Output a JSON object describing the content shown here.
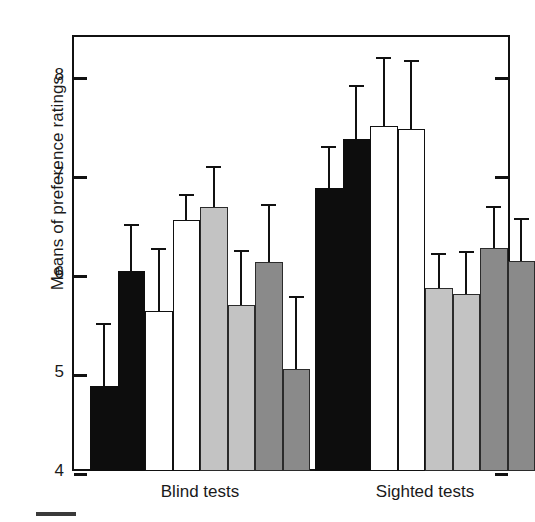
{
  "chart_data": {
    "type": "bar",
    "title": "",
    "xlabel": "",
    "ylabel": "Means of preference ratings",
    "ylim": [
      4,
      8.4
    ],
    "yticks": [
      4,
      5,
      6,
      7,
      8
    ],
    "ytick_labels": [
      "4",
      "5",
      "6",
      "7",
      "8"
    ],
    "grid": false,
    "legend": "none",
    "error_bars": "standard deviation / confidence interval (upper caps only)",
    "categories": [
      "Blind tests",
      "Sighted tests"
    ],
    "groups": [
      {
        "name": "Blind tests",
        "bars": [
          {
            "index": 1,
            "value": 4.86,
            "error_top": 5.49,
            "fill": "black"
          },
          {
            "index": 2,
            "value": 6.02,
            "error_top": 6.49,
            "fill": "black"
          },
          {
            "index": 3,
            "value": 5.61,
            "error_top": 6.25,
            "fill": "white"
          },
          {
            "index": 4,
            "value": 6.53,
            "error_top": 6.8,
            "fill": "white"
          },
          {
            "index": 5,
            "value": 6.66,
            "error_top": 7.08,
            "fill": "light-gray"
          },
          {
            "index": 6,
            "value": 5.68,
            "error_top": 6.23,
            "fill": "light-gray"
          },
          {
            "index": 7,
            "value": 6.11,
            "error_top": 6.69,
            "fill": "dark-gray"
          },
          {
            "index": 8,
            "value": 5.03,
            "error_top": 5.77,
            "fill": "dark-gray"
          }
        ]
      },
      {
        "name": "Sighted tests",
        "bars": [
          {
            "index": 1,
            "value": 6.86,
            "error_top": 7.28,
            "fill": "black"
          },
          {
            "index": 2,
            "value": 7.35,
            "error_top": 7.9,
            "fill": "black"
          },
          {
            "index": 3,
            "value": 7.48,
            "error_top": 8.18,
            "fill": "white"
          },
          {
            "index": 4,
            "value": 7.45,
            "error_top": 8.15,
            "fill": "white"
          },
          {
            "index": 5,
            "value": 5.85,
            "error_top": 6.2,
            "fill": "light-gray"
          },
          {
            "index": 6,
            "value": 5.79,
            "error_top": 6.22,
            "fill": "light-gray"
          },
          {
            "index": 7,
            "value": 6.25,
            "error_top": 6.67,
            "fill": "dark-gray"
          },
          {
            "index": 8,
            "value": 6.12,
            "error_top": 6.55,
            "fill": "dark-gray"
          }
        ]
      }
    ],
    "colors": {
      "black": "#0d0d0d",
      "white": "#ffffff",
      "light-gray": "#c3c3c3",
      "dark-gray": "#8a8a8a",
      "axis": "#111111"
    }
  }
}
